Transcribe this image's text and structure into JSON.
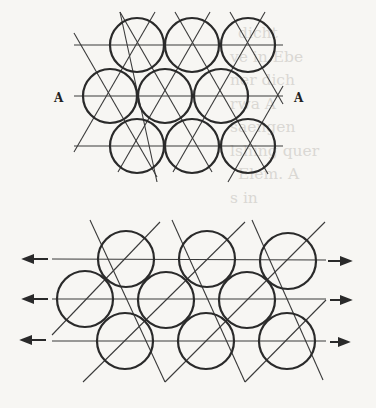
{
  "figure_top": {
    "label_left": "A",
    "label_right": "A",
    "description": "Hexagonal close packing of circles (3 rows x 3), with lattice lines at 0°, 60°, 120°",
    "rows": [
      {
        "y": 45,
        "centers_x": [
          137,
          192,
          248
        ]
      },
      {
        "y": 96,
        "centers_x": [
          110,
          165,
          221
        ]
      },
      {
        "y": 146,
        "centers_x": [
          137,
          192,
          248
        ]
      }
    ],
    "radius": 27
  },
  "figure_bottom": {
    "description": "Circle packing under shear/tension, lattice lines at 0°, ±45°, with arrows pointing outward on each row",
    "rows": [
      {
        "y": 259,
        "centers_x": [
          126,
          207,
          288
        ]
      },
      {
        "y": 299,
        "centers_x": [
          85,
          166,
          247
        ]
      },
      {
        "y": 341,
        "centers_x": [
          125,
          206,
          287
        ]
      }
    ],
    "radius": 28,
    "arrows": {
      "left": "←",
      "right": "→"
    }
  },
  "bleed_through_text": [
    "dicht",
    "ve in Ebe",
    "ner dich",
    "rwa A",
    "saengen",
    "lshing quer",
    "Elem. A",
    "s in"
  ]
}
